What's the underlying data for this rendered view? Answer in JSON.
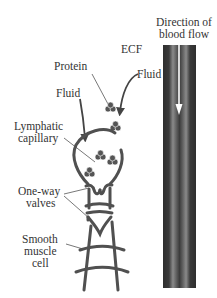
{
  "labels": {
    "blood_flow_line1": "Direction of",
    "blood_flow_line2": "blood flow",
    "ecf": "ECF",
    "protein": "Protein",
    "fluid_right": "Fluid",
    "fluid_left": "Fluid",
    "lymphatic_line1": "Lymphatic",
    "lymphatic_line2": "capillary",
    "valves_line1": "One-way",
    "valves_line2": "valves",
    "muscle_line1": "Smooth",
    "muscle_line2": "muscle",
    "muscle_line3": "cell"
  },
  "colors": {
    "stroke": "#505050",
    "vessel_dark": "#3a3a3a",
    "vessel_mid": "#6a6a6a",
    "vessel_light": "#9a9a9a",
    "text": "#333333"
  }
}
